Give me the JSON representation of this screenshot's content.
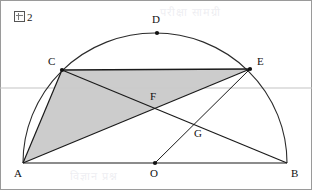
{
  "figure": {
    "caption_prefix": "図",
    "caption_number": "2",
    "caption_full": "図 2",
    "type": "semicircle-geometry-diagram",
    "width": 312,
    "height": 190
  },
  "colors": {
    "stroke": "#1a1a1a",
    "arc_stroke": "#2b2b2b",
    "shade_fill": "#c9c9c9",
    "guide_line": "#c0c0c0",
    "border": "#9a9a9a",
    "background": "#ffffff",
    "label_text": "#111111"
  },
  "geometry": {
    "center": {
      "x": 155,
      "y": 163
    },
    "radius": 132,
    "baseline_y": 163,
    "guide_line_y": 88
  },
  "points": [
    {
      "id": "A",
      "label": "A",
      "x": 23,
      "y": 163,
      "label_x": 14,
      "label_y": 168,
      "marker": false,
      "on": "diameter-left-end"
    },
    {
      "id": "B",
      "label": "B",
      "x": 287,
      "y": 163,
      "label_x": 291,
      "label_y": 168,
      "marker": false,
      "on": "diameter-right-end"
    },
    {
      "id": "C",
      "label": "C",
      "x": 62,
      "y": 70,
      "label_x": 48,
      "label_y": 59,
      "marker": true,
      "on": "arc"
    },
    {
      "id": "D",
      "label": "D",
      "x": 157,
      "y": 33,
      "label_x": 151,
      "label_y": 14,
      "marker": true,
      "on": "arc-apex"
    },
    {
      "id": "E",
      "label": "E",
      "x": 250,
      "y": 69,
      "label_x": 256,
      "label_y": 59,
      "marker": true,
      "on": "arc"
    },
    {
      "id": "F",
      "label": "F",
      "x": 155,
      "y": 112,
      "label_x": 149,
      "label_y": 93,
      "marker": false,
      "on": "intersection-AE-CB"
    },
    {
      "id": "G",
      "label": "G",
      "x": 196,
      "y": 133,
      "label_x": 192,
      "label_y": 128,
      "marker": false,
      "on": "intersection-OE-CB"
    },
    {
      "id": "O",
      "label": "O",
      "x": 155,
      "y": 163,
      "label_x": 149,
      "label_y": 168,
      "marker": true,
      "on": "center"
    }
  ],
  "segments": [
    {
      "name": "diameter-AB",
      "from": "A",
      "to": "B",
      "style": "solid"
    },
    {
      "name": "chord-CE",
      "from": "C",
      "to": "E",
      "style": "solid"
    },
    {
      "name": "chord-AC",
      "from": "A",
      "to": "C",
      "style": "solid"
    },
    {
      "name": "chord-AE",
      "from": "A",
      "to": "E",
      "style": "solid"
    },
    {
      "name": "chord-CB",
      "from": "C",
      "to": "B",
      "style": "solid"
    },
    {
      "name": "radius-OE",
      "from": "O",
      "to": "E",
      "style": "solid"
    }
  ],
  "arc": {
    "name": "semicircular-arc-ADB",
    "from": "A",
    "to": "B",
    "through": "D",
    "style": "solid"
  },
  "shaded_region": {
    "name": "quadrilateral-ACEF",
    "vertices": [
      "A",
      "C",
      "E",
      "A"
    ],
    "description": "triangle A-C-E filled gray"
  },
  "watermark": {
    "lines": [
      {
        "text": "विज्ञान प्रश्न",
        "x": 70,
        "y": 172,
        "size": 11
      },
      {
        "text": "परीक्षा सामग्री",
        "x": 160,
        "y": 8,
        "size": 10
      }
    ]
  }
}
